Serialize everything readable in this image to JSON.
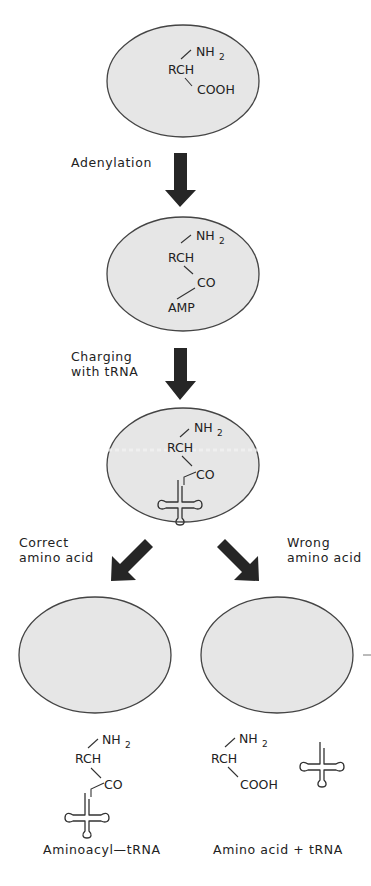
{
  "diagram": {
    "colors": {
      "cell_fill": "#e6e6e6",
      "cell_stroke": "#444444",
      "arrow": "#262626",
      "text": "#222222"
    },
    "step1": {
      "nh2": "NH",
      "nh2_sub": "2",
      "rch": "RCH",
      "cooh": "COOH"
    },
    "arrow1_label": "Adenylation",
    "step2": {
      "nh2": "NH",
      "nh2_sub": "2",
      "rch": "RCH",
      "co": "CO",
      "amp": "AMP"
    },
    "arrow2_label_line1": "Charging",
    "arrow2_label_line2": "with tRNA",
    "step3": {
      "nh2": "NH",
      "nh2_sub": "2",
      "rch": "RCH",
      "co": "CO"
    },
    "branch_left_label_line1": "Correct",
    "branch_left_label_line2": "amino acid",
    "branch_right_label_line1": "Wrong",
    "branch_right_label_line2": "amino acid",
    "result_left": {
      "nh2": "NH",
      "nh2_sub": "2",
      "rch": "RCH",
      "co": "CO",
      "caption": "Aminoacyl—tRNA"
    },
    "result_right": {
      "nh2": "NH",
      "nh2_sub": "2",
      "rch": "RCH",
      "cooh": "COOH",
      "caption": "Amino acid + tRNA"
    }
  }
}
